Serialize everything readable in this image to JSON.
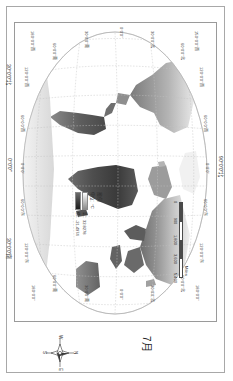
{
  "map": {
    "title": "7月",
    "graticule": {
      "lon_labels_top": [
        "150°0'0\"西",
        "120°0'0\"西",
        "60°0'0\"西",
        "0°0'0\"",
        "60°0'0\"东",
        "120°0'0\"东",
        "180°0'0\""
      ],
      "lon_labels_bottom": [
        "180°0'0\"西",
        "120°0'0\"西",
        "60°0'0\"西",
        "0°0'0\"",
        "60°0'0\"东",
        "120°0'0\"东",
        "180°0'0\""
      ],
      "lat_labels_left": [
        "60°0'0\"北",
        "30°0'0\"北",
        "0°0'0\"",
        "30°0'0\"南",
        "60°0'0\"南"
      ],
      "lat_labels_right": [
        "60°0'0\"北",
        "30°0'0\"北",
        "0°0'0\"",
        "30°0'0\"南",
        "60°0'0\"南"
      ],
      "axis_top": "90°0'0\"北",
      "axis_bottom": "0°0'0\"",
      "axis_left_outer": "30°0'0\"北",
      "axis_right_outer": "30°0'0\"南"
    }
  },
  "legend": {
    "title": "图例",
    "unit": "单位：°C",
    "high_label": "高：32.8278",
    "low_label": "低：-21.4974"
  },
  "scalebar": {
    "units": "Miles",
    "ticks": [
      "0",
      "900",
      "1,800",
      "3,600",
      "5,400"
    ]
  },
  "compass": {
    "north": "N",
    "south": "S",
    "east": "E",
    "west": "W"
  },
  "colors": {
    "frame": "#9a9a9a",
    "graticule": "#b9b9b9",
    "land_light": "#c9c9c9",
    "land_dark": "#3d3d3d",
    "text": "#2b2b2b"
  }
}
